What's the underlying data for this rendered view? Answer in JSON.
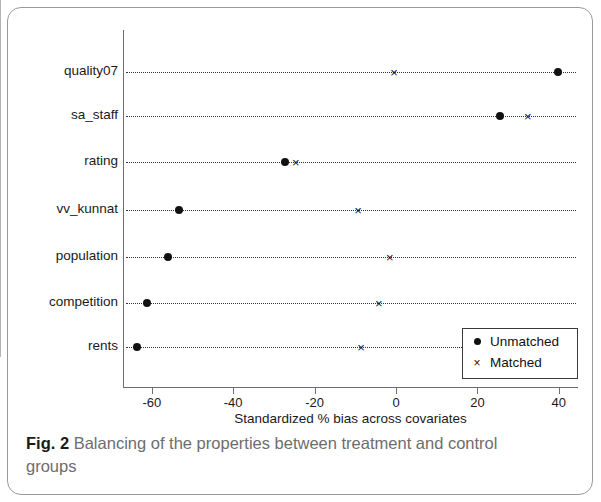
{
  "caption": {
    "label": "Fig. 2",
    "text": "Balancing of the properties between treatment and control groups"
  },
  "legend": {
    "position": "bottom-right",
    "entries": [
      {
        "label": "Unmatched",
        "marker": "filled-circle-icon"
      },
      {
        "label": "Matched",
        "marker": "cross-x-icon"
      }
    ]
  },
  "chart_data": {
    "type": "scatter",
    "orientation": "horizontal",
    "title": "",
    "subtitle": "",
    "xlabel": "Standardized % bias across covariates",
    "ylabel": "",
    "xlim": [
      -68,
      46
    ],
    "xticks": [
      -60,
      -40,
      -20,
      0,
      20,
      40
    ],
    "xtick_labels": [
      "-60",
      "-40",
      "-20",
      "0",
      "20",
      "40"
    ],
    "grid": "dotted-horizontal-rows",
    "zero_reference_line": 0,
    "categories": [
      "quality07",
      "sa_staff",
      "rating",
      "vv_kunnat",
      "population",
      "competition",
      "rents"
    ],
    "series": [
      {
        "name": "Unmatched",
        "marker": "filled-circle-icon",
        "values": [
          39.8,
          25.6,
          -27.3,
          -53.3,
          -56.0,
          -61.2,
          -63.6
        ]
      },
      {
        "name": "Matched",
        "marker": "cross-x-icon",
        "values": [
          -0.5,
          32.4,
          -24.6,
          -9.3,
          -1.5,
          -4.2,
          -8.6
        ]
      }
    ]
  }
}
